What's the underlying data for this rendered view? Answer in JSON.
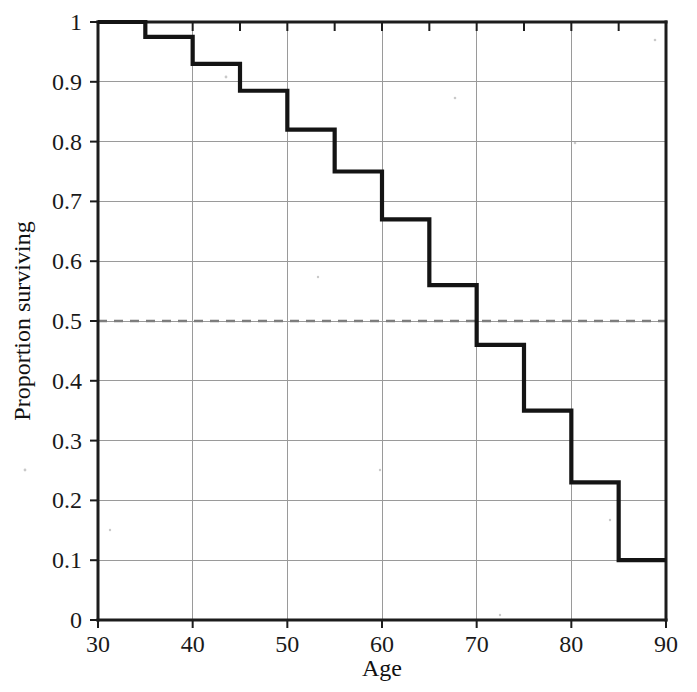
{
  "chart_data": {
    "type": "line",
    "subtype": "step-post",
    "title": "",
    "xlabel": "Age",
    "ylabel": "Proportion surviving",
    "xlim": [
      30,
      90
    ],
    "ylim": [
      0,
      1
    ],
    "grid": true,
    "legend": "none",
    "x_ticks": [
      30,
      40,
      50,
      60,
      70,
      80,
      90
    ],
    "x_tick_labels": [
      "30",
      "40",
      "50",
      "60",
      "70",
      "80",
      "90"
    ],
    "x_minor_ticks": [
      35,
      45,
      55,
      65,
      75,
      85
    ],
    "y_ticks": [
      0,
      0.1,
      0.2,
      0.3,
      0.4,
      0.5,
      0.6,
      0.7,
      0.8,
      0.9,
      1
    ],
    "y_tick_labels": [
      "0",
      "0.1",
      "0.2",
      "0.3",
      "0.4",
      "0.5",
      "0.6",
      "0.7",
      "0.8",
      "0.9",
      "1"
    ],
    "x": [
      30,
      35,
      40,
      45,
      50,
      55,
      60,
      65,
      70,
      75,
      80,
      85,
      90
    ],
    "values": [
      1.0,
      0.975,
      0.93,
      0.885,
      0.82,
      0.75,
      0.67,
      0.56,
      0.46,
      0.35,
      0.23,
      0.1,
      0.1
    ],
    "steps": [
      {
        "x_start": 30,
        "x_end": 35,
        "y": 1.0
      },
      {
        "x_start": 35,
        "x_end": 40,
        "y": 0.975
      },
      {
        "x_start": 40,
        "x_end": 45,
        "y": 0.93
      },
      {
        "x_start": 45,
        "x_end": 50,
        "y": 0.885
      },
      {
        "x_start": 50,
        "x_end": 55,
        "y": 0.82
      },
      {
        "x_start": 55,
        "x_end": 60,
        "y": 0.75
      },
      {
        "x_start": 60,
        "x_end": 65,
        "y": 0.67
      },
      {
        "x_start": 65,
        "x_end": 70,
        "y": 0.56
      },
      {
        "x_start": 70,
        "x_end": 75,
        "y": 0.46
      },
      {
        "x_start": 75,
        "x_end": 80,
        "y": 0.35
      },
      {
        "x_start": 80,
        "x_end": 85,
        "y": 0.23
      },
      {
        "x_start": 85,
        "x_end": 90,
        "y": 0.1
      }
    ],
    "annotations": [
      {
        "type": "hline",
        "y": 0.5,
        "style": "dashed",
        "label": "",
        "color": "#7d7d7d"
      }
    ],
    "series_color": "#141414",
    "grid_color": "#9a9a9a",
    "axis_color": "#1c1c1c",
    "background": "#ffffff"
  }
}
